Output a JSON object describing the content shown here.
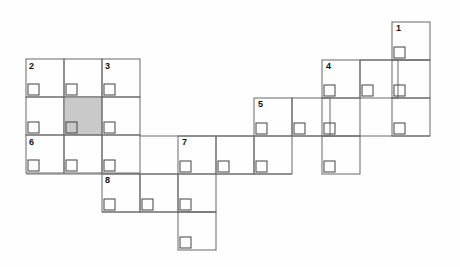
{
  "figure": {
    "title": "",
    "type": "grid-puzzle-diagram",
    "background_color": "#fefefe",
    "line_color": "#6e6e6e",
    "notch_color": "#4a4a4a",
    "shade_color": "#c9c9c9",
    "label_color": "#111111",
    "cell_size": 38,
    "notch_size": 11
  },
  "labels": [
    {
      "id": "label-1",
      "text": "1",
      "x": 396,
      "y": 25
    },
    {
      "id": "label-2",
      "text": "2",
      "x": 29,
      "y": 63
    },
    {
      "id": "label-3",
      "text": "3",
      "x": 105,
      "y": 63
    },
    {
      "id": "label-4",
      "text": "4",
      "x": 326,
      "y": 63
    },
    {
      "id": "label-5",
      "text": "5",
      "x": 258,
      "y": 101
    },
    {
      "id": "label-6",
      "text": "6",
      "x": 29,
      "y": 139
    },
    {
      "id": "label-7",
      "text": "7",
      "x": 182,
      "y": 139
    },
    {
      "id": "label-8",
      "text": "8",
      "x": 105,
      "y": 177
    }
  ],
  "cells": [
    {
      "id": "c1-r0",
      "x": 392,
      "y": 22,
      "shaded": false
    },
    {
      "id": "c1-r1",
      "x": 392,
      "y": 60,
      "shaded": false
    },
    {
      "id": "c1-r2",
      "x": 392,
      "y": 98,
      "shaded": false
    },
    {
      "id": "c4-a",
      "x": 322,
      "y": 60,
      "shaded": false
    },
    {
      "id": "c4-b",
      "x": 360,
      "y": 60,
      "shaded": false
    },
    {
      "id": "c4-c",
      "x": 322,
      "y": 98,
      "shaded": false
    },
    {
      "id": "c4-d",
      "x": 322,
      "y": 136,
      "shaded": false
    },
    {
      "id": "c5-a",
      "x": 254,
      "y": 98,
      "shaded": false
    },
    {
      "id": "c5-b",
      "x": 292,
      "y": 98,
      "shaded": false
    },
    {
      "id": "c5-c",
      "x": 254,
      "y": 136,
      "shaded": false
    },
    {
      "id": "c2-a",
      "x": 26,
      "y": 59,
      "shaded": false
    },
    {
      "id": "c2-b",
      "x": 64,
      "y": 59,
      "shaded": false
    },
    {
      "id": "c3-a",
      "x": 102,
      "y": 59,
      "shaded": false
    },
    {
      "id": "c2-c",
      "x": 26,
      "y": 97,
      "shaded": false
    },
    {
      "id": "shaded",
      "x": 64,
      "y": 97,
      "shaded": true
    },
    {
      "id": "c3-b",
      "x": 102,
      "y": 97,
      "shaded": false
    },
    {
      "id": "c6-a",
      "x": 26,
      "y": 135,
      "shaded": false
    },
    {
      "id": "c6-b",
      "x": 64,
      "y": 135,
      "shaded": false
    },
    {
      "id": "c6-c",
      "x": 102,
      "y": 135,
      "shaded": false
    },
    {
      "id": "c7-a",
      "x": 178,
      "y": 136,
      "shaded": false
    },
    {
      "id": "c7-b",
      "x": 216,
      "y": 136,
      "shaded": false
    },
    {
      "id": "c7-c",
      "x": 178,
      "y": 174,
      "shaded": false
    },
    {
      "id": "c7-d",
      "x": 178,
      "y": 212,
      "shaded": false
    },
    {
      "id": "c8-a",
      "x": 102,
      "y": 174,
      "shaded": false
    },
    {
      "id": "c8-b",
      "x": 140,
      "y": 174,
      "shaded": false
    }
  ],
  "connectors": [
    {
      "id": "conn-top-right",
      "x1": 360,
      "y1": 60,
      "x2": 430,
      "y2": 60
    },
    {
      "id": "conn-mid-right",
      "x1": 292,
      "y1": 136,
      "x2": 430,
      "y2": 136
    },
    {
      "id": "conn-mid-left",
      "x1": 140,
      "y1": 136,
      "x2": 254,
      "y2": 136
    },
    {
      "id": "conn-low",
      "x1": 26,
      "y1": 174,
      "x2": 178,
      "y2": 174
    },
    {
      "id": "conn-low-right",
      "x1": 216,
      "y1": 174,
      "x2": 292,
      "y2": 174
    },
    {
      "id": "conn-bottom",
      "x1": 102,
      "y1": 212,
      "x2": 216,
      "y2": 212
    }
  ]
}
